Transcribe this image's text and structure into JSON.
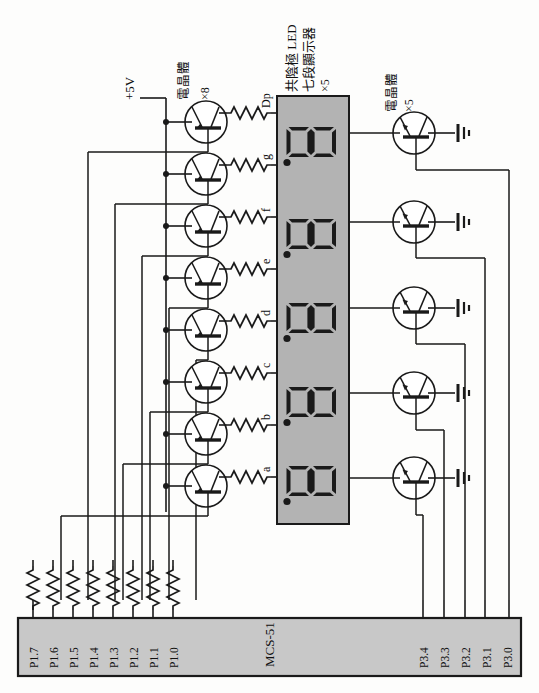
{
  "diagram": {
    "orientation": "landscape-rotated-90",
    "colors": {
      "panel_fill": "#b3b3b3",
      "chip_fill": "#c8c8c8",
      "wire": "#1a1a1a",
      "segment": "#1a1a1a",
      "background": "#fdfdfc"
    }
  },
  "power": {
    "rail_label": "+5V"
  },
  "transistors_segment": {
    "group_label": "電晶體",
    "count_label": "×8",
    "type": "PNP",
    "count": 8
  },
  "transistors_digit": {
    "group_label": "電晶體",
    "count_label": "×5",
    "type": "NPN",
    "count": 5
  },
  "display": {
    "label_line1": "共陰極 LED",
    "label_line2": "七段顯示器",
    "label_line3": "×5",
    "digit_glyph": "8.",
    "digits": 5
  },
  "segment_pins": [
    {
      "label": "Dp"
    },
    {
      "label": "g"
    },
    {
      "label": "f"
    },
    {
      "label": "e"
    },
    {
      "label": "d"
    },
    {
      "label": "c"
    },
    {
      "label": "b"
    },
    {
      "label": "a"
    }
  ],
  "mcu": {
    "name": "MCS-51",
    "port1_pins": [
      {
        "label": "P1.7"
      },
      {
        "label": "P1.6"
      },
      {
        "label": "P1.5"
      },
      {
        "label": "P1.4"
      },
      {
        "label": "P1.3"
      },
      {
        "label": "P1.2"
      },
      {
        "label": "P1.1"
      },
      {
        "label": "P1.0"
      }
    ],
    "port3_pins": [
      {
        "label": "P3.4"
      },
      {
        "label": "P3.3"
      },
      {
        "label": "P3.2"
      },
      {
        "label": "P3.1"
      },
      {
        "label": "P3.0"
      }
    ]
  },
  "ground": {
    "symbol_name": "earth-ground",
    "count": 5
  }
}
